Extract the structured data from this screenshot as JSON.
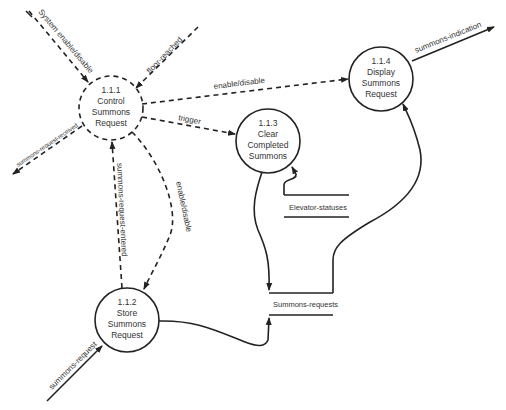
{
  "diagram": {
    "type": "data-flow-diagram",
    "processes": [
      {
        "id": "1.1.1",
        "lines": [
          "1.1.1",
          "Control",
          "Summons",
          "Request"
        ],
        "style": "control"
      },
      {
        "id": "1.1.2",
        "lines": [
          "1.1.2",
          "Store",
          "Summons",
          "Request"
        ],
        "style": "data"
      },
      {
        "id": "1.1.3",
        "lines": [
          "1.1.3",
          "Clear",
          "Completed",
          "Summons"
        ],
        "style": "data"
      },
      {
        "id": "1.1.4",
        "lines": [
          "1.1.4",
          "Display",
          "Summons",
          "Request"
        ],
        "style": "data"
      }
    ],
    "stores": [
      {
        "name": "Elevator-statuses"
      },
      {
        "name": "Summons-requests"
      }
    ],
    "flows": [
      {
        "label": "System enable/disable",
        "from": "external",
        "to": "1.1.1",
        "kind": "control"
      },
      {
        "label": "floor-reached",
        "from": "external",
        "to": "1.1.1",
        "kind": "control"
      },
      {
        "label": "summons-request-received",
        "from": "1.1.1",
        "to": "external",
        "kind": "control"
      },
      {
        "label": "enable/disable",
        "from": "1.1.1",
        "to": "1.1.4",
        "kind": "control"
      },
      {
        "label": "trigger",
        "from": "1.1.1",
        "to": "1.1.3",
        "kind": "control"
      },
      {
        "label": "summons-request-entered",
        "from": "1.1.2",
        "to": "1.1.1",
        "kind": "control"
      },
      {
        "label": "enable/disable",
        "from": "1.1.1",
        "to": "1.1.2",
        "kind": "control"
      },
      {
        "label": "summons-indication",
        "from": "1.1.4",
        "to": "external",
        "kind": "data"
      },
      {
        "label": "summons-request",
        "from": "external",
        "to": "1.1.2",
        "kind": "data"
      },
      {
        "label": "",
        "from": "1.1.2",
        "to": "Summons-requests",
        "kind": "data"
      },
      {
        "label": "",
        "from": "1.1.3",
        "to": "Summons-requests",
        "kind": "data"
      },
      {
        "label": "",
        "from": "Summons-requests",
        "to": "1.1.4",
        "kind": "data"
      },
      {
        "label": "",
        "from": "Elevator-statuses",
        "to": "1.1.3",
        "kind": "data"
      }
    ]
  }
}
